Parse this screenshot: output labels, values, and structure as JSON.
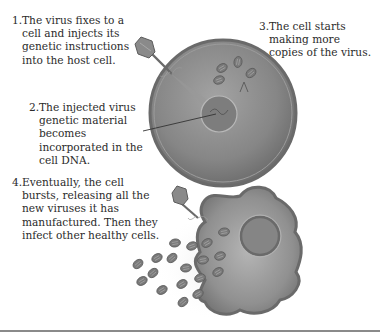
{
  "diagram": {
    "steps": [
      {
        "number": "1.",
        "text": "The virus fixes to a cell and injects its genetic instructions into the host cell."
      },
      {
        "number": "2.",
        "text": "The injected virus genetic material becomes incorporated in the cell DNA."
      },
      {
        "number": "3.",
        "text": "The cell starts making more copies of the virus."
      },
      {
        "number": "4.",
        "text": "Eventually, the cell bursts, releasing all the new viruses it has manufactured. Then they infect other healthy cells."
      }
    ],
    "illustrations": {
      "top": "host cell with attached virus injecting genetic material into nucleus, new virus copies forming",
      "bottom": "bursting cell releasing many new virus particles"
    },
    "colors": {
      "cell_fill": "#8c8c8c",
      "cell_edge": "#6f6f6f",
      "nucleus": "#7d7d7d",
      "virus": "#7a7a7a",
      "text": "#2b2b2b",
      "rule": "#8a8a8a"
    }
  }
}
